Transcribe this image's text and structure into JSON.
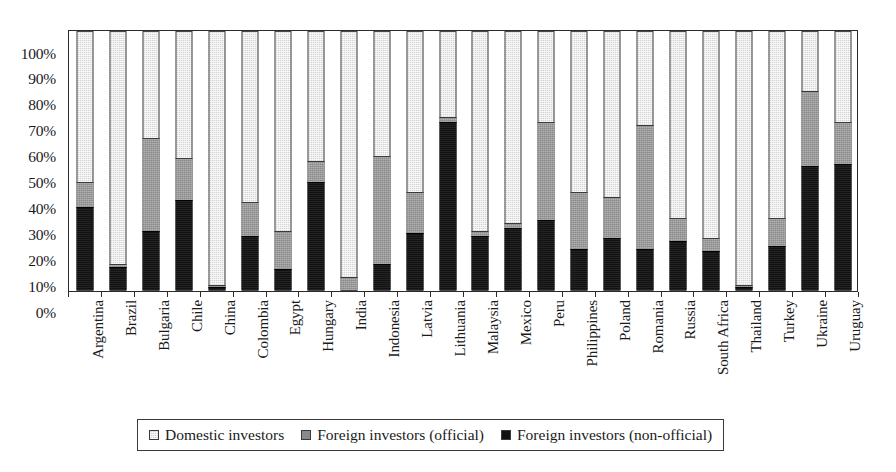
{
  "chart_data": {
    "type": "bar",
    "subtype": "stacked-100-percent",
    "title": "",
    "xlabel": "",
    "ylabel": "",
    "ylim": [
      0,
      100
    ],
    "ytick_labels": [
      "0%",
      "10%",
      "20%",
      "30%",
      "40%",
      "50%",
      "60%",
      "70%",
      "80%",
      "90%",
      "100%"
    ],
    "ytick_values": [
      0,
      10,
      20,
      30,
      40,
      50,
      60,
      70,
      80,
      90,
      100
    ],
    "grid": false,
    "legend_position": "bottom",
    "categories": [
      "Argentina",
      "Brazil",
      "Bulgaria",
      "Chile",
      "China",
      "Colombia",
      "Egypt",
      "Hungary",
      "India",
      "Indonesia",
      "Latvia",
      "Lithuania",
      "Malaysia",
      "Mexico",
      "Peru",
      "Philippines",
      "Poland",
      "Romania",
      "Russia",
      "South Africa",
      "Thailand",
      "Turkey",
      "Ukraine",
      "Uruguay"
    ],
    "series": [
      {
        "name": "Foreign investors (non-official)",
        "color": "#121212",
        "values": [
          32,
          9,
          23,
          35,
          1,
          21,
          8,
          42,
          0,
          10,
          22,
          65,
          21,
          24,
          27,
          16,
          20,
          16,
          19,
          15,
          1,
          17,
          48,
          49
        ]
      },
      {
        "name": "Foreign investors (official)",
        "color": "#8a8a8a",
        "values": [
          10,
          1,
          36,
          16,
          1,
          13,
          15,
          8,
          5,
          42,
          16,
          2,
          2,
          2,
          38,
          22,
          16,
          48,
          9,
          5,
          1,
          11,
          29,
          16
        ]
      },
      {
        "name": "Domestic investors",
        "color": "#d4d4d4",
        "values": [
          58,
          90,
          41,
          49,
          98,
          66,
          77,
          50,
          95,
          48,
          62,
          33,
          77,
          74,
          35,
          62,
          64,
          36,
          72,
          80,
          98,
          72,
          23,
          35
        ]
      }
    ],
    "cumulative_tops": {
      "note": "cumulative stack tops in percent, bottom-up: non-official then official",
      "non_official": [
        32,
        9,
        23,
        35,
        1,
        21,
        8,
        42,
        0,
        10,
        22,
        65,
        21,
        24,
        27,
        16,
        20,
        16,
        19,
        15,
        1,
        17,
        48,
        49
      ],
      "official": [
        42,
        10,
        59,
        51,
        2,
        34,
        23,
        50,
        5,
        52,
        38,
        67,
        23,
        26,
        65,
        38,
        36,
        64,
        28,
        20,
        2,
        28,
        77,
        65
      ]
    }
  },
  "legend": {
    "items": [
      {
        "label": "Domestic investors",
        "swatch": "light-gray-swatch"
      },
      {
        "label": "Foreign investors (official)",
        "swatch": "medium-gray-swatch"
      },
      {
        "label": "Foreign investors (non-official)",
        "swatch": "black-swatch"
      }
    ]
  }
}
